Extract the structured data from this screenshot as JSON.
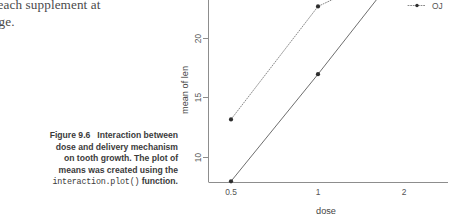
{
  "page": {
    "body_text": "gth for each supplement at\nch dosage."
  },
  "caption": {
    "figure_label": "Figure 9.6",
    "line1": "Interaction between",
    "line2": "dose and delivery mechanism",
    "line3": "on tooth growth. The plot of",
    "line4": "means was created using the",
    "code": "interaction.plot()",
    "line5": "function."
  },
  "chart_data": {
    "type": "line",
    "title": "",
    "xlabel": "dose",
    "ylabel": "mean of  len",
    "x": [
      0.5,
      1,
      2
    ],
    "xtick_labels": [
      "0.5",
      "1",
      "2"
    ],
    "ytick_labels": [
      "10",
      "15",
      "20"
    ],
    "yticks": [
      10,
      15,
      20
    ],
    "ylim": [
      7.2,
      27.5
    ],
    "grid": false,
    "legend_position": "top-right",
    "series": [
      {
        "name": "VC",
        "values": [
          8.0,
          17.0,
          26.2
        ],
        "linestyle": "solid",
        "color": "#6e6e6e"
      },
      {
        "name": "OJ",
        "values": [
          13.2,
          22.7,
          26.1
        ],
        "linestyle": "dotted",
        "color": "#8a8a8a"
      }
    ],
    "legend": [
      {
        "label": "VC",
        "linestyle": "solid"
      },
      {
        "label": "OJ",
        "linestyle": "dotted"
      }
    ]
  }
}
